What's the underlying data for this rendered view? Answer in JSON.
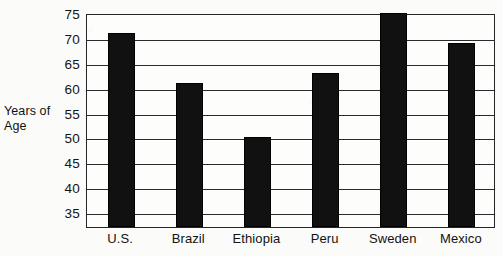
{
  "chart_data": {
    "type": "bar",
    "title": "",
    "xlabel": "",
    "ylabel": "Years of Age",
    "ylabel_lines": [
      "Years of",
      "Age"
    ],
    "categories": [
      "U.S.",
      "Brazil",
      "Ethiopia",
      "Peru",
      "Sweden",
      "Mexico"
    ],
    "values": [
      71,
      61,
      50,
      63,
      75,
      69
    ],
    "ylim": [
      32,
      75
    ],
    "yticks": [
      35,
      40,
      45,
      50,
      55,
      60,
      65,
      70,
      75
    ],
    "ytick_labels": [
      "35",
      "40",
      "45",
      "50",
      "55",
      "60",
      "65",
      "70",
      "75"
    ],
    "grid": true,
    "legend": "none",
    "bar_color": "#111111",
    "axis_color": "#2b2b2e",
    "background_color": "#fbfbf9",
    "note": "y-axis is truncated; bars are drawn from the frame baseline below the 35 gridline"
  }
}
